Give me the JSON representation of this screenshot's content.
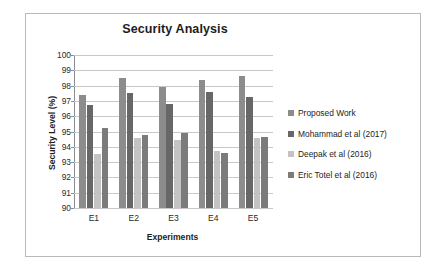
{
  "chart_data": {
    "type": "bar",
    "title": "Security Analysis",
    "xlabel": "Experiments",
    "ylabel": "Security Level (%)",
    "categories": [
      "E1",
      "E2",
      "E3",
      "E4",
      "E5"
    ],
    "ylim": [
      90,
      100
    ],
    "yticks": [
      100,
      99,
      98,
      97,
      96,
      95,
      94,
      93,
      92,
      91,
      90
    ],
    "grid": true,
    "legend_position": "right",
    "series": [
      {
        "name": "Proposed Work",
        "color": "#8c8c8c",
        "values": [
          97.4,
          98.5,
          97.9,
          98.35,
          98.65
        ]
      },
      {
        "name": "Mohammad et al (2017)",
        "color": "#676767",
        "values": [
          96.75,
          97.55,
          96.8,
          97.6,
          97.25
        ]
      },
      {
        "name": "Deepak et al (2016)",
        "color": "#c3c3c3",
        "values": [
          93.5,
          94.6,
          94.45,
          93.7,
          94.55
        ]
      },
      {
        "name": "Eric Totel et al (2016)",
        "color": "#7b7b7b",
        "values": [
          95.2,
          94.8,
          94.9,
          93.6,
          94.65
        ]
      }
    ]
  }
}
